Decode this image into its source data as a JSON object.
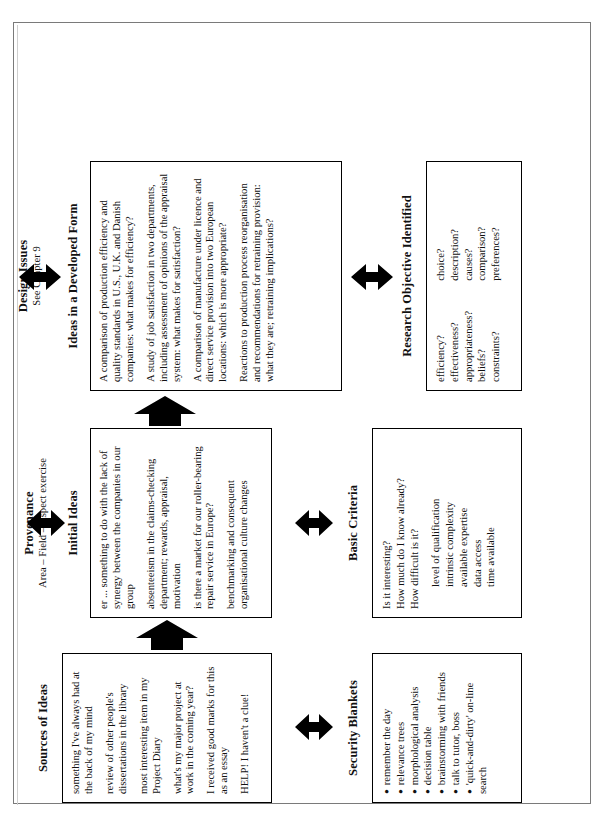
{
  "figure": {
    "sections": {
      "sources": {
        "title": "Sources of Ideas",
        "items": [
          "something I've always had at the back of my mind",
          "review of other people's dissertations in the library",
          "most interesting item in my Project Diary",
          "what's my major project at work in the coming year?",
          "I received good marks for this as an essay",
          "HELP! I haven't a clue!"
        ]
      },
      "security_blankets": {
        "title": "Security Blankets",
        "items": [
          "remember the day",
          "relevance trees",
          "morphological analysis",
          "decision table",
          "brainstorming with friends",
          "talk to tutor, boss",
          "'quick-and-dirty' on-line search"
        ]
      },
      "provenance": {
        "title": "Provenance",
        "subtitle": "Area – Field – Aspect exercise"
      },
      "initial_ideas": {
        "title": "Initial Ideas",
        "items": [
          "er ... something to do with the lack of synergy  between the companies in our group",
          "absenteeism in the claims-checking department; rewards, appraisal, motivation",
          "is there a market for our roller-bearing repair service in Europe?",
          "benchmarking and consequent organisational culture changes"
        ]
      },
      "basic_criteria": {
        "title": "Basic Criteria",
        "items": [
          "Is it interesting?",
          "How much do I know already?",
          "How difficult is it?",
          "level of qualification",
          "intrinsic complexity",
          "available expertise",
          "data access",
          "time available"
        ],
        "indented_from": 3
      },
      "design_issues": {
        "title": "Design Issues",
        "subtitle": "See Chapter 9"
      },
      "ideas_developed": {
        "title": "Ideas in a Developed Form",
        "items": [
          "A comparison of production efficiency and quality standards in U.S., U.K.  and Danish companies: what makes for efficiency?",
          "A study of job satisfaction in two departments, including assessment of opinions of the appraisal system: what makes for satisfaction?",
          "A comparison of manufacture under licence and direct service provision into two European locations: which is more appropriate?",
          "Reactions to production process reorganisation and recommendations for retraining provision: what they are; retraining implications?"
        ]
      },
      "research_objective": {
        "title": "Research Objective Identified",
        "column_left": [
          "efficiency?",
          "effectiveness?",
          "appropriateness?",
          "beliefs?",
          "constraints?"
        ],
        "column_right": [
          "choice?",
          "description?",
          "causes?",
          "comparison?",
          "preferences?"
        ]
      }
    },
    "arrows": {
      "double_headed": "double-headed-arrow",
      "flow": "block-arrow"
    }
  }
}
